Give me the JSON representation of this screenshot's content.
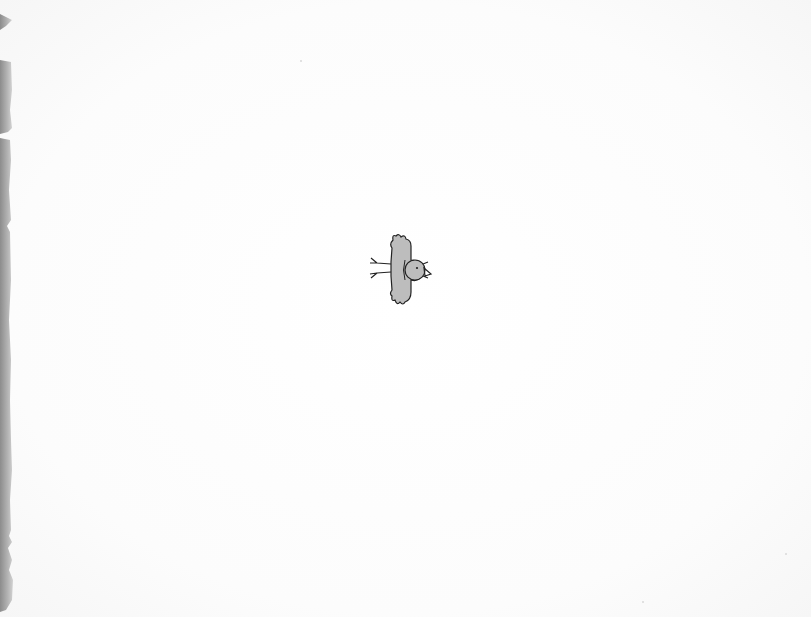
{
  "page": {
    "background_color": "#fdfdfd",
    "edge_color": "#a8a8a8"
  },
  "illustration": {
    "subject": "bird-in-flight",
    "fill_color": "#bdbdbd",
    "outline_color": "#222222",
    "position": {
      "x": 365,
      "y": 230,
      "width": 70,
      "height": 78
    }
  }
}
